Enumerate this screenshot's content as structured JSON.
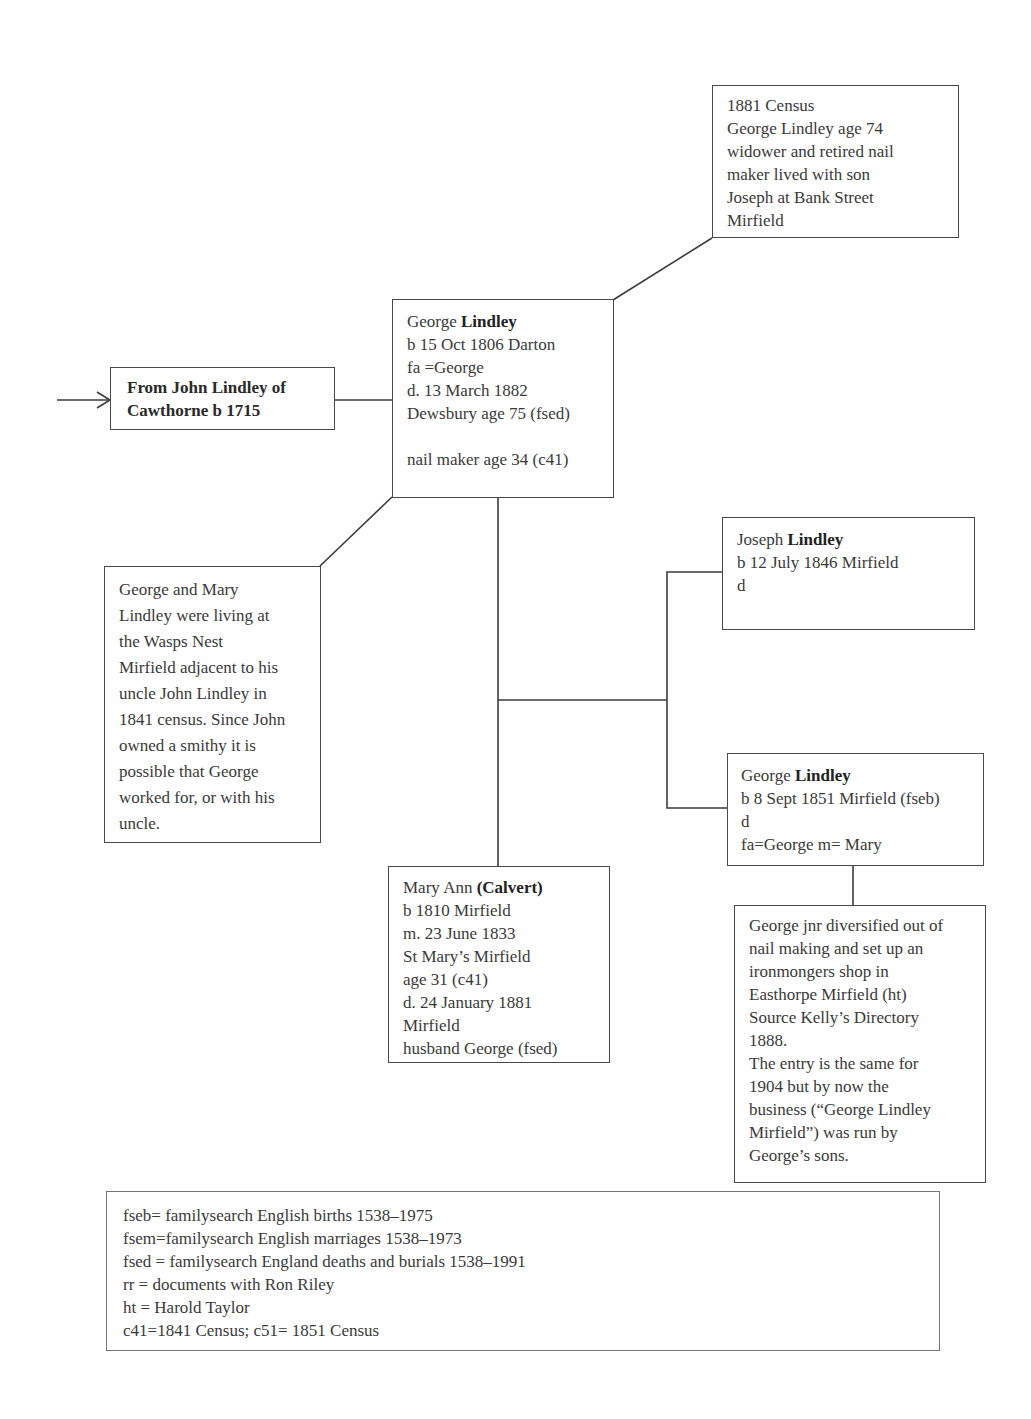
{
  "census_1881": {
    "lines": [
      "1881 Census",
      "George Lindley age 74",
      "widower and retired nail",
      "maker lived with son",
      "Joseph at Bank Street",
      "Mirfield"
    ]
  },
  "ancestor": {
    "line1": "From John Lindley of",
    "line2": "Cawthorne  b 1715"
  },
  "george_sr": {
    "first_name": "George ",
    "surname": "Lindley",
    "lines": [
      "b 15 Oct 1806 Darton",
      "fa =George",
      "d. 13 March 1882",
      "Dewsbury age 75 (fsed)",
      "",
      "nail maker age 34 (c41)"
    ]
  },
  "note_1841": {
    "lines": [
      "George and Mary",
      "Lindley were living at",
      "the Wasps Nest",
      "Mirfield adjacent to his",
      "uncle John Lindley in",
      "1841 census. Since John",
      "owned a smithy it is",
      "possible that George",
      "worked for, or with his",
      "uncle."
    ]
  },
  "joseph": {
    "first_name": "Joseph ",
    "surname": "Lindley",
    "lines": [
      "b 12 July 1846 Mirfield",
      "d"
    ]
  },
  "george_jr": {
    "first_name": "George ",
    "surname": "Lindley",
    "lines": [
      "b 8 Sept 1851 Mirfield (fseb)",
      "d",
      "fa=George m= Mary"
    ]
  },
  "mary_ann": {
    "first_name": "Mary Ann ",
    "surname": "(Calvert)",
    "lines": [
      "b 1810 Mirfield",
      "m. 23 June 1833",
      "St Mary’s Mirfield",
      "age 31 (c41)",
      "d. 24 January 1881",
      "Mirfield",
      "husband George (fsed)"
    ]
  },
  "note_ironmonger": {
    "lines": [
      "George jnr diversified out of",
      "nail making and  set up an",
      "ironmongers shop in",
      "Easthorpe Mirfield (ht)",
      "Source Kelly’s Directory",
      "1888.",
      "The entry is the same for",
      "1904 but by now the",
      "business (“George Lindley",
      "Mirfield”) was run by",
      "George’s sons."
    ]
  },
  "legend": {
    "lines": [
      "fseb= familysearch English births 1538–1975",
      "fsem=familysearch English marriages 1538–1973",
      "fsed = familysearch England  deaths and burials 1538–1991",
      "rr = documents with Ron Riley",
      "ht = Harold Taylor",
      "c41=1841 Census; c51= 1851 Census"
    ]
  }
}
